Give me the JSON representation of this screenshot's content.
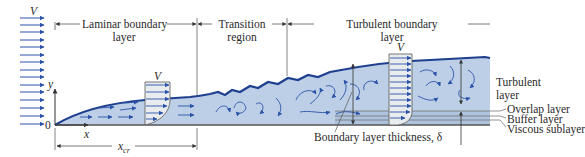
{
  "labels": {
    "freestream_velocity": "V",
    "laminar_region_line1": "Laminar boundary",
    "laminar_region_line2": "layer",
    "transition_line1": "Transition",
    "transition_line2": "region",
    "turbulent_region_line1": "Turbulent boundary",
    "turbulent_region_line2": "layer",
    "laminar_profile_velocity": "V",
    "turbulent_profile_velocity": "V",
    "y_axis": "y",
    "x_axis": "x",
    "origin": "0",
    "x_critical": "x",
    "x_critical_subscript": "cr",
    "turbulent_layer_line1": "Turbulent",
    "turbulent_layer_line2": "layer",
    "overlap_layer": "Overlap layer",
    "buffer_layer": "Buffer layer",
    "viscous_sublayer": "Viscous sublayer",
    "thickness": "Boundary layer thickness, δ"
  },
  "colors": {
    "boundary_fill": "#bccfe6",
    "boundary_edge": "#1f3f8f",
    "arrow": "#2b53a8",
    "line": "#555555",
    "profile_fill": "#e9ecef",
    "text": "#2a2a2a"
  }
}
